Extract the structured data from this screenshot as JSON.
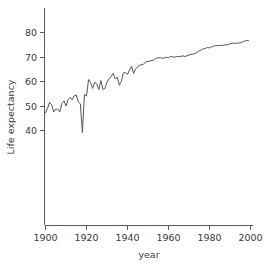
{
  "chart_data": {
    "type": "line",
    "title": "",
    "xlabel": "year",
    "ylabel": "Life expectancy",
    "xlim": [
      1898,
      2002
    ],
    "ylim": [
      35,
      82
    ],
    "xticks": [
      1900,
      1920,
      1940,
      1960,
      1980,
      2000
    ],
    "yticks": [
      40,
      50,
      60,
      70,
      80
    ],
    "grid": false,
    "legend": null,
    "line_color": "#555555",
    "series": [
      {
        "name": "Life expectancy",
        "x": [
          1900,
          1901,
          1902,
          1903,
          1904,
          1905,
          1906,
          1907,
          1908,
          1909,
          1910,
          1911,
          1912,
          1913,
          1914,
          1915,
          1916,
          1917,
          1918,
          1919,
          1920,
          1921,
          1922,
          1923,
          1924,
          1925,
          1926,
          1927,
          1928,
          1929,
          1930,
          1931,
          1932,
          1933,
          1934,
          1935,
          1936,
          1937,
          1938,
          1939,
          1940,
          1941,
          1942,
          1943,
          1944,
          1945,
          1946,
          1947,
          1948,
          1949,
          1950,
          1951,
          1952,
          1953,
          1954,
          1955,
          1956,
          1957,
          1958,
          1959,
          1960,
          1961,
          1962,
          1963,
          1964,
          1965,
          1966,
          1967,
          1968,
          1969,
          1970,
          1971,
          1972,
          1973,
          1974,
          1975,
          1976,
          1977,
          1978,
          1979,
          1980,
          1981,
          1982,
          1983,
          1984,
          1985,
          1986,
          1987,
          1988,
          1989,
          1990,
          1991,
          1992,
          1993,
          1994,
          1995,
          1996,
          1997,
          1998,
          1999
        ],
        "values": [
          47.3,
          49.1,
          51.5,
          50.5,
          47.6,
          48.7,
          48.7,
          47.6,
          51.1,
          52.1,
          50.0,
          52.6,
          53.5,
          52.5,
          54.2,
          54.5,
          51.7,
          50.9,
          39.1,
          54.7,
          54.1,
          60.8,
          59.6,
          57.2,
          59.7,
          59.0,
          56.7,
          60.4,
          56.8,
          57.1,
          59.7,
          61.1,
          62.1,
          63.3,
          61.1,
          61.7,
          58.5,
          60.0,
          63.5,
          63.7,
          62.9,
          64.8,
          66.2,
          63.3,
          65.2,
          65.9,
          66.7,
          66.8,
          67.2,
          68.0,
          68.2,
          68.4,
          68.6,
          68.8,
          69.6,
          69.6,
          69.7,
          69.5,
          69.6,
          69.9,
          69.7,
          70.2,
          70.1,
          69.9,
          70.2,
          70.2,
          70.2,
          70.5,
          70.2,
          70.5,
          70.8,
          71.1,
          71.2,
          71.4,
          72.0,
          72.6,
          72.9,
          73.3,
          73.5,
          73.9,
          73.7,
          74.1,
          74.5,
          74.6,
          74.7,
          74.7,
          74.7,
          74.9,
          74.9,
          75.1,
          75.4,
          75.5,
          75.8,
          75.5,
          75.7,
          75.8,
          76.1,
          76.5,
          76.7,
          76.7
        ]
      }
    ]
  },
  "axes": {
    "y_tick_labels": [
      "80",
      "70",
      "60",
      "50",
      "40"
    ],
    "x_tick_labels": [
      "1900",
      "1920",
      "1940",
      "1960",
      "1980",
      "2000"
    ],
    "x_title": "year",
    "y_title": "Life expectancy"
  }
}
